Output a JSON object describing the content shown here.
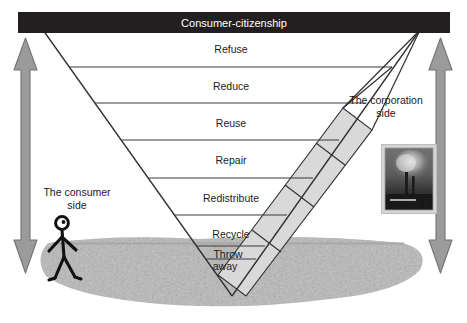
{
  "figure": {
    "title": "Consumer-citizenship",
    "background_color": "#ffffff"
  },
  "banner": {
    "label": "Consumer-citizenship",
    "fill": "#231f20",
    "text_color": "#ffffff"
  },
  "hierarchy": {
    "tiers": [
      {
        "label": "Refuse"
      },
      {
        "label": "Reduce"
      },
      {
        "label": "Reuse"
      },
      {
        "label": "Repair"
      },
      {
        "label": "Redistribute"
      },
      {
        "label": "Recycle"
      },
      {
        "label": "Throw away",
        "line1": "Throw",
        "line2": "away"
      }
    ]
  },
  "annotations": {
    "consumer_side": {
      "line1": "The consumer",
      "line2": "side"
    },
    "corporation_side": {
      "line1": "The corporation",
      "line2": "side"
    }
  },
  "arrows": {
    "left": {
      "name": "double-headed-vertical-arrow",
      "fill": "#9b9b9b",
      "stroke": "#6e6e6e"
    },
    "right": {
      "name": "double-headed-vertical-arrow",
      "fill": "#9b9b9b",
      "stroke": "#6e6e6e"
    }
  },
  "figures": {
    "stick_person": {
      "name": "stick-figure-consumer",
      "color": "#111111"
    },
    "factory_photo": {
      "name": "factory-smokestack-photo",
      "frame_color": "#c8c8c8"
    }
  },
  "ground": {
    "name": "ground-texture",
    "fill": "#b4b4b4"
  },
  "colors": {
    "band_fill": "#d9d9d9",
    "band_stroke": "#333333",
    "line": "#333333",
    "triangle_fill": "#ffffff"
  }
}
